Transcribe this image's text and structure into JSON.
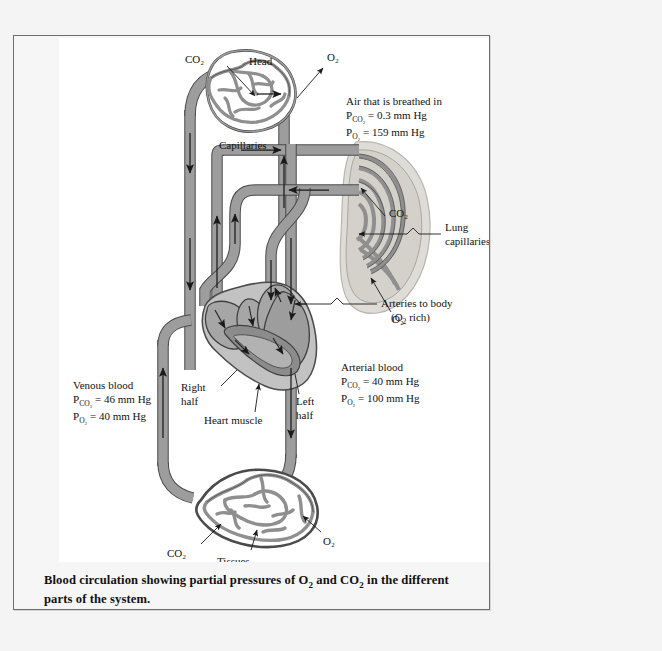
{
  "figure": {
    "caption": "Blood circulation showing partial pressures of O₂ and CO₂ in the different parts of the system.",
    "caption_line1": "Blood circulation showing partial pressures of O",
    "caption_line1b": " and CO",
    "caption_line1c": " in the different",
    "caption_line2": "parts of the system."
  },
  "labels": {
    "head": "Head",
    "capillaries": "Capillaries",
    "head_co2": "CO₂",
    "head_o2": "O₂",
    "lung_co2": "CO₂",
    "lung_o2": "O₂",
    "lung_capillaries_line1": "Lung",
    "lung_capillaries_line2": "capillaries",
    "right_half_line1": "Right",
    "right_half_line2": "half",
    "left_half_line1": "Left",
    "left_half_line2": "half",
    "heart_muscle": "Heart muscle",
    "tissues_co2": "CO₂",
    "tissues_o2": "O₂"
  },
  "annotations": {
    "air_breathed": {
      "title": "Air that is breathed in",
      "pco2": "P",
      "pco2_sub": "CO₂",
      "pco2_value": " = 0.3 mm Hg",
      "po2_sub": "O₂",
      "po2_value": " = 159 mm Hg"
    },
    "arteries_to_body": {
      "line1": "Arteries to body",
      "line2_pre": "(O",
      "line2_sub": "2",
      "line2_post": " rich)"
    },
    "arterial_blood": {
      "title": "Arterial blood",
      "pco2_sub": "CO₂",
      "pco2_value": " = 40 mm Hg",
      "po2_sub": "O₂",
      "po2_value": " = 100 mm Hg"
    },
    "venous_blood": {
      "title": "Venous blood",
      "pco2_sub": "CO₂",
      "pco2_value": " = 46 mm Hg",
      "po2_sub": "O₂",
      "po2_value": " = 40 mm Hg"
    },
    "tissues": {
      "title": "Tissues",
      "pco2_sub": "CO₂",
      "pco2_value": " = 60 mm Hg",
      "po2_sub": "O₂",
      "po2_value": " = 30 mm Hg"
    },
    "p_symbol": "P"
  },
  "colors": {
    "vessel_fill": "#9d9d9d",
    "vessel_stroke": "#4a4a4a",
    "lung_fill": "#d7d7d2",
    "heart_fill": "#b4b4b4",
    "heart_inner": "#8f8f8f",
    "page_background": "#f4f4f4",
    "figure_background": "#ffffff",
    "border": "#6d6d6d",
    "text": "#121212"
  }
}
